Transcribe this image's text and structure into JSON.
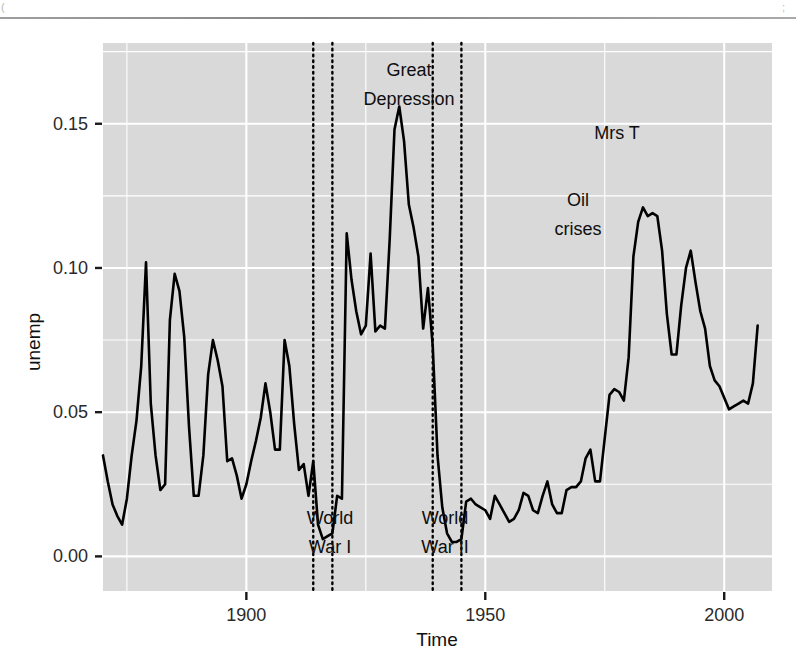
{
  "figure": {
    "background_color": "#ffffff",
    "panel_color": "#d9d9d9",
    "grid_color": "#ffffff",
    "line_color": "#000000"
  },
  "axis": {
    "y_title": "unemp",
    "x_title": "Time",
    "y_ticks": [
      "0.00",
      "0.05",
      "0.10",
      "0.15"
    ],
    "x_ticks": [
      "1900",
      "1950",
      "2000"
    ]
  },
  "annotations": {
    "great_depression": "Great\nDepression",
    "great_depression_l1": "Great",
    "great_depression_l2": "Depression",
    "world_war_1_l1": "World",
    "world_war_1_l2": "War I",
    "world_war_2_l1": "World",
    "world_war_2_l2": "War II",
    "oil_crises_l1": "Oil",
    "oil_crises_l2": "crises",
    "mrs_t": "Mrs T"
  },
  "chart_data": {
    "type": "line",
    "title": "",
    "xlabel": "Time",
    "ylabel": "unemp",
    "xlim": [
      1870,
      2010
    ],
    "ylim": [
      -0.012,
      0.178
    ],
    "grid": true,
    "grid_major_y": [
      0.0,
      0.05,
      0.1,
      0.15
    ],
    "grid_minor_y": [
      0.025,
      0.075,
      0.125,
      0.175
    ],
    "grid_major_x": [
      1900,
      1950,
      2000
    ],
    "grid_minor_x": [
      1875,
      1925,
      1975
    ],
    "legend": "none",
    "y_tick_values": [
      0.0,
      0.05,
      0.1,
      0.15
    ],
    "x_tick_values": [
      1900,
      1950,
      2000
    ],
    "event_bands": [
      {
        "name": "World War I",
        "start": 1914,
        "end": 1918,
        "label_l1": "World",
        "label_l2": "War I",
        "label_y": 0.0,
        "style": "dotted-vertical-pair"
      },
      {
        "name": "World War II",
        "start": 1939,
        "end": 1945,
        "label_l1": "World",
        "label_l2": "War II",
        "label_y": 0.0,
        "style": "dotted-vertical-pair"
      }
    ],
    "text_annotations": [
      {
        "text": "Great Depression",
        "x": 1929,
        "y": 0.172
      },
      {
        "text": "Mrs T",
        "x": 1981,
        "y": 0.152
      },
      {
        "text": "Oil crises",
        "x": 1972,
        "y": 0.131
      }
    ],
    "series": [
      {
        "name": "unemp",
        "x": [
          1870,
          1871,
          1872,
          1873,
          1874,
          1875,
          1876,
          1877,
          1878,
          1879,
          1880,
          1881,
          1882,
          1883,
          1884,
          1885,
          1886,
          1887,
          1888,
          1889,
          1890,
          1891,
          1892,
          1893,
          1894,
          1895,
          1896,
          1897,
          1898,
          1899,
          1900,
          1901,
          1902,
          1903,
          1904,
          1905,
          1906,
          1907,
          1908,
          1909,
          1910,
          1911,
          1912,
          1913,
          1914,
          1915,
          1916,
          1917,
          1918,
          1919,
          1920,
          1921,
          1922,
          1923,
          1924,
          1925,
          1926,
          1927,
          1928,
          1929,
          1930,
          1931,
          1932,
          1933,
          1934,
          1935,
          1936,
          1937,
          1938,
          1939,
          1940,
          1941,
          1942,
          1943,
          1944,
          1945,
          1946,
          1947,
          1948,
          1949,
          1950,
          1951,
          1952,
          1953,
          1954,
          1955,
          1956,
          1957,
          1958,
          1959,
          1960,
          1961,
          1962,
          1963,
          1964,
          1965,
          1966,
          1967,
          1968,
          1969,
          1970,
          1971,
          1972,
          1973,
          1974,
          1975,
          1976,
          1977,
          1978,
          1979,
          1980,
          1981,
          1982,
          1983,
          1984,
          1985,
          1986,
          1987,
          1988,
          1989,
          1990,
          1991,
          1992,
          1993,
          1994,
          1995,
          1996,
          1997,
          1998,
          1999,
          2000,
          2001,
          2002,
          2003,
          2004,
          2005,
          2006,
          2007
        ],
        "y": [
          0.035,
          0.026,
          0.018,
          0.014,
          0.011,
          0.02,
          0.035,
          0.047,
          0.066,
          0.102,
          0.053,
          0.035,
          0.023,
          0.025,
          0.082,
          0.098,
          0.092,
          0.076,
          0.045,
          0.021,
          0.021,
          0.035,
          0.063,
          0.075,
          0.068,
          0.059,
          0.033,
          0.034,
          0.028,
          0.02,
          0.025,
          0.033,
          0.04,
          0.048,
          0.06,
          0.05,
          0.037,
          0.037,
          0.075,
          0.066,
          0.046,
          0.03,
          0.032,
          0.021,
          0.033,
          0.011,
          0.006,
          0.007,
          0.008,
          0.021,
          0.02,
          0.112,
          0.096,
          0.085,
          0.077,
          0.08,
          0.105,
          0.078,
          0.08,
          0.079,
          0.11,
          0.148,
          0.156,
          0.144,
          0.122,
          0.114,
          0.104,
          0.079,
          0.093,
          0.073,
          0.035,
          0.017,
          0.008,
          0.005,
          0.005,
          0.006,
          0.019,
          0.02,
          0.018,
          0.017,
          0.016,
          0.013,
          0.021,
          0.018,
          0.015,
          0.012,
          0.013,
          0.016,
          0.022,
          0.021,
          0.016,
          0.015,
          0.021,
          0.026,
          0.018,
          0.015,
          0.015,
          0.023,
          0.024,
          0.024,
          0.026,
          0.034,
          0.037,
          0.026,
          0.026,
          0.041,
          0.056,
          0.058,
          0.057,
          0.054,
          0.069,
          0.104,
          0.116,
          0.121,
          0.118,
          0.119,
          0.118,
          0.106,
          0.084,
          0.07,
          0.07,
          0.087,
          0.1,
          0.106,
          0.095,
          0.085,
          0.079,
          0.066,
          0.061,
          0.059,
          0.055,
          0.051,
          0.052,
          0.053,
          0.054,
          0.053,
          0.06,
          0.08
        ]
      }
    ]
  }
}
